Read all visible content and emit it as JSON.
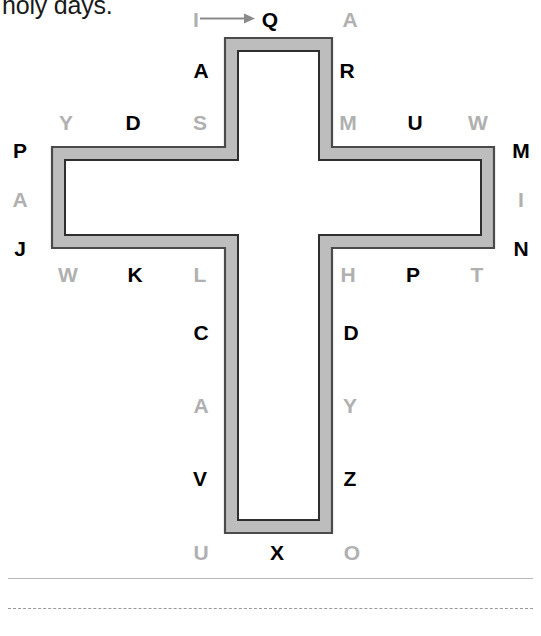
{
  "worksheet": {
    "instruction_fragment": "holy days.",
    "start_marker": {
      "from": "I",
      "to": "Q",
      "arrow": "right-arrow-icon"
    }
  },
  "figure": {
    "shape_name": "cross-outline",
    "fill_color": "#bdbdbd",
    "border_color": "#3a3a3a",
    "inner_fill": "#ffffff",
    "band_thickness": 14
  },
  "letters": [
    {
      "id": "l-i",
      "char": "I",
      "tone": "light",
      "x": 196,
      "y": 19
    },
    {
      "id": "l-q",
      "char": "Q",
      "tone": "dark",
      "x": 270,
      "y": 19
    },
    {
      "id": "l-a1",
      "char": "A",
      "tone": "light",
      "x": 350,
      "y": 19
    },
    {
      "id": "l-a2",
      "char": "A",
      "tone": "dark",
      "x": 201,
      "y": 70
    },
    {
      "id": "l-r",
      "char": "R",
      "tone": "dark",
      "x": 347,
      "y": 70
    },
    {
      "id": "l-y",
      "char": "Y",
      "tone": "light",
      "x": 66,
      "y": 122
    },
    {
      "id": "l-d1",
      "char": "D",
      "tone": "dark",
      "x": 133,
      "y": 122
    },
    {
      "id": "l-s",
      "char": "S",
      "tone": "light",
      "x": 200,
      "y": 122
    },
    {
      "id": "l-m1",
      "char": "M",
      "tone": "light",
      "x": 348,
      "y": 122
    },
    {
      "id": "l-u1",
      "char": "U",
      "tone": "dark",
      "x": 415,
      "y": 122
    },
    {
      "id": "l-w1",
      "char": "W",
      "tone": "light",
      "x": 478,
      "y": 122
    },
    {
      "id": "l-p1",
      "char": "P",
      "tone": "dark",
      "x": 20,
      "y": 150
    },
    {
      "id": "l-m2",
      "char": "M",
      "tone": "dark",
      "x": 521,
      "y": 150
    },
    {
      "id": "l-a3",
      "char": "A",
      "tone": "light",
      "x": 20,
      "y": 199
    },
    {
      "id": "l-i2",
      "char": "I",
      "tone": "light",
      "x": 521,
      "y": 199
    },
    {
      "id": "l-j",
      "char": "J",
      "tone": "dark",
      "x": 20,
      "y": 248
    },
    {
      "id": "l-n",
      "char": "N",
      "tone": "dark",
      "x": 521,
      "y": 248
    },
    {
      "id": "l-w2",
      "char": "W",
      "tone": "light",
      "x": 68,
      "y": 274
    },
    {
      "id": "l-k",
      "char": "K",
      "tone": "dark",
      "x": 135,
      "y": 274
    },
    {
      "id": "l-l",
      "char": "L",
      "tone": "light",
      "x": 200,
      "y": 274
    },
    {
      "id": "l-h",
      "char": "H",
      "tone": "light",
      "x": 348,
      "y": 274
    },
    {
      "id": "l-p2",
      "char": "P",
      "tone": "dark",
      "x": 413,
      "y": 274
    },
    {
      "id": "l-t",
      "char": "T",
      "tone": "light",
      "x": 477,
      "y": 274
    },
    {
      "id": "l-c",
      "char": "C",
      "tone": "dark",
      "x": 201,
      "y": 332
    },
    {
      "id": "l-d2",
      "char": "D",
      "tone": "dark",
      "x": 351,
      "y": 332
    },
    {
      "id": "l-a4",
      "char": "A",
      "tone": "light",
      "x": 201,
      "y": 405
    },
    {
      "id": "l-y2",
      "char": "Y",
      "tone": "light",
      "x": 350,
      "y": 405
    },
    {
      "id": "l-v",
      "char": "V",
      "tone": "dark",
      "x": 200,
      "y": 478
    },
    {
      "id": "l-z",
      "char": "Z",
      "tone": "dark",
      "x": 350,
      "y": 478
    },
    {
      "id": "l-u2",
      "char": "U",
      "tone": "light",
      "x": 201,
      "y": 552
    },
    {
      "id": "l-x",
      "char": "X",
      "tone": "dark",
      "x": 277,
      "y": 552
    },
    {
      "id": "l-o",
      "char": "O",
      "tone": "light",
      "x": 352,
      "y": 552
    }
  ],
  "answer_lines": [
    {
      "id": "line-solid",
      "style": "solid"
    },
    {
      "id": "line-dashed",
      "style": "dashed"
    }
  ]
}
